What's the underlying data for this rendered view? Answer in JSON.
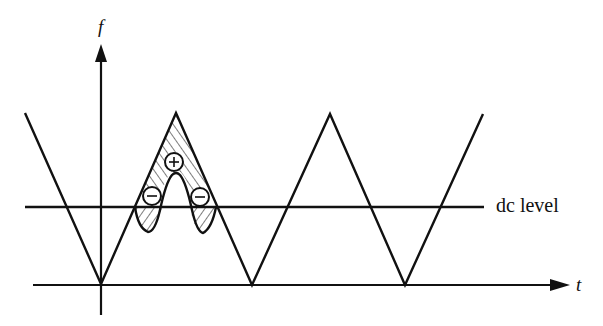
{
  "axes": {
    "y_label": "f",
    "x_label": "t"
  },
  "annotations": {
    "dc_level": "dc level",
    "plus_sign": "+",
    "minus_sign": "−"
  },
  "colors": {
    "ink": "#111111",
    "background": "#ffffff"
  },
  "waveform": {
    "type": "triangle",
    "points": [
      [
        25,
        113
      ],
      [
        101,
        284
      ],
      [
        176,
        113
      ],
      [
        252,
        285
      ],
      [
        330,
        114
      ],
      [
        405,
        285
      ],
      [
        483,
        114
      ]
    ]
  }
}
